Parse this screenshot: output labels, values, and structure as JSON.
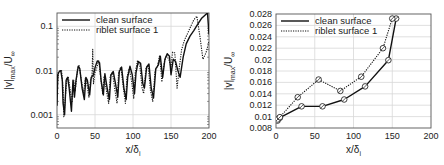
{
  "chart_data": [
    {
      "type": "line",
      "title": "",
      "xlabel": "x/δ_i",
      "ylabel": "|v|_max/U_∞",
      "yscale": "log",
      "xlim": [
        0,
        200
      ],
      "ylim": [
        0.0005,
        0.2
      ],
      "xticks": [
        0,
        50,
        100,
        150,
        200
      ],
      "yticks": [
        0.001,
        0.01,
        0.1
      ],
      "ytick_labels": [
        "0.001",
        "0.01",
        "0.1"
      ],
      "grid": true,
      "legend_position": "upper left",
      "series": [
        {
          "name": "clean surface",
          "style": "solid",
          "x": [
            0,
            1,
            3,
            5,
            7,
            8,
            10,
            12,
            14,
            16,
            19,
            21,
            23,
            25,
            28,
            30,
            33,
            36,
            38,
            40,
            43,
            45,
            48,
            50,
            53,
            56,
            58,
            61,
            63,
            66,
            69,
            71,
            74,
            77,
            80,
            82,
            85,
            88,
            91,
            93,
            96,
            99,
            102,
            104,
            107,
            110,
            113,
            115,
            118,
            121,
            124,
            127,
            130,
            133,
            136,
            139,
            142,
            145,
            148,
            150,
            153,
            156,
            159,
            162,
            166,
            170,
            175,
            180,
            185,
            190,
            195,
            198,
            200
          ],
          "y": [
            0.0016,
            0.008,
            0.0095,
            0.0099,
            0.006,
            0.0018,
            0.001,
            0.006,
            0.007,
            0.004,
            0.0012,
            0.006,
            0.0025,
            0.006,
            0.0125,
            0.011,
            0.004,
            0.0022,
            0.007,
            0.006,
            0.0028,
            0.007,
            0.008,
            0.0115,
            0.0165,
            0.015,
            0.006,
            0.0028,
            0.0085,
            0.004,
            0.0022,
            0.008,
            0.0095,
            0.005,
            0.0025,
            0.0095,
            0.012,
            0.004,
            0.0022,
            0.007,
            0.0125,
            0.008,
            0.003,
            0.009,
            0.016,
            0.0145,
            0.005,
            0.004,
            0.012,
            0.014,
            0.004,
            0.0024,
            0.011,
            0.013,
            0.021,
            0.007,
            0.018,
            0.024,
            0.021,
            0.008,
            0.018,
            0.016,
            0.01,
            0.007,
            0.02,
            0.04,
            0.06,
            0.08,
            0.11,
            0.15,
            0.18,
            0.2,
            0.065
          ]
        },
        {
          "name": "riblet surface 1",
          "style": "dotted",
          "x": [
            0,
            2,
            4,
            6,
            8,
            9,
            11,
            13,
            15,
            18,
            20,
            22,
            24,
            27,
            29,
            32,
            35,
            37,
            39,
            42,
            44,
            46,
            47,
            48,
            50,
            52,
            55,
            57,
            60,
            62,
            65,
            68,
            70,
            73,
            76,
            79,
            81,
            84,
            87,
            90,
            92,
            95,
            98,
            101,
            103,
            106,
            109,
            112,
            114,
            117,
            120,
            123,
            126,
            129,
            132,
            135,
            138,
            141,
            144,
            147,
            150,
            152,
            155,
            158,
            161,
            164,
            168,
            172,
            176,
            180,
            184,
            188,
            192,
            196,
            200
          ],
          "y": [
            0.004,
            0.009,
            0.0097,
            0.01,
            0.004,
            0.0009,
            0.0025,
            0.0065,
            0.007,
            0.003,
            0.002,
            0.006,
            0.0035,
            0.011,
            0.013,
            0.006,
            0.003,
            0.0065,
            0.0055,
            0.0025,
            0.006,
            0.007,
            0.03,
            0.005,
            0.009,
            0.011,
            0.017,
            0.008,
            0.003,
            0.0075,
            0.0035,
            0.0018,
            0.0075,
            0.009,
            0.0038,
            0.0018,
            0.009,
            0.012,
            0.0045,
            0.0018,
            0.007,
            0.011,
            0.006,
            0.0023,
            0.009,
            0.017,
            0.0125,
            0.004,
            0.003,
            0.011,
            0.013,
            0.0035,
            0.002,
            0.01,
            0.012,
            0.022,
            0.0055,
            0.015,
            0.022,
            0.018,
            0.012,
            0.026,
            0.025,
            0.004,
            0.012,
            0.03,
            0.05,
            0.07,
            0.1,
            0.14,
            0.17,
            0.06,
            0.018,
            0.025,
            0.045
          ]
        }
      ]
    },
    {
      "type": "line",
      "title": "",
      "xlabel": "x/δ_i",
      "ylabel": "|v|_max/U_∞",
      "yscale": "linear",
      "xlim": [
        0,
        200
      ],
      "ylim": [
        0.008,
        0.028
      ],
      "xticks": [
        0,
        50,
        100,
        150,
        200
      ],
      "yticks": [
        0.008,
        0.01,
        0.012,
        0.014,
        0.016,
        0.018,
        0.02,
        0.022,
        0.024,
        0.026,
        0.028
      ],
      "ytick_labels": [
        "0.008",
        "0.01",
        "0.012",
        "0.014",
        "0.016",
        "0.018",
        "0.02",
        "0.022",
        "0.024",
        "0.026",
        "0.028"
      ],
      "grid": true,
      "legend_position": "upper left",
      "series": [
        {
          "name": "clean surface",
          "style": "solid",
          "marker": "circle-cross",
          "x": [
            2,
            5,
            33,
            60,
            88,
            115,
            145,
            155
          ],
          "y": [
            0.0093,
            0.0098,
            0.0118,
            0.0118,
            0.013,
            0.0153,
            0.0199,
            0.0272
          ]
        },
        {
          "name": "riblet surface 1",
          "style": "dotted",
          "marker": "circle-cross",
          "x": [
            2,
            5,
            28,
            55,
            83,
            110,
            138,
            150
          ],
          "y": [
            0.0095,
            0.0099,
            0.0134,
            0.0165,
            0.0145,
            0.017,
            0.022,
            0.0272
          ]
        }
      ]
    }
  ],
  "left_chart": {
    "xlabel_main": "x/δ",
    "xlabel_sub": "i",
    "ylabel_main": "|v|",
    "ylabel_sub": "max",
    "ylabel_tail": "/U",
    "ylabel_inf": "∞",
    "legend": [
      "clean surface",
      "riblet surface 1"
    ]
  },
  "right_chart": {
    "xlabel_main": "x/δ",
    "xlabel_sub": "i",
    "ylabel_main": "|v|",
    "ylabel_sub": "max",
    "ylabel_tail": "/U",
    "ylabel_inf": "∞",
    "legend": [
      "clean surface",
      "riblet surface 1"
    ]
  },
  "colors": {
    "line": "#111111",
    "grid": "#d8d8d8",
    "frame": "#555555",
    "text": "#222222"
  }
}
